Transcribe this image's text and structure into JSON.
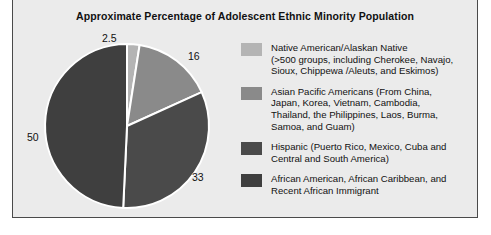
{
  "figure": {
    "title": "Approximate Percentage of Adolescent Ethnic Minority Population",
    "background_color": "#ebebeb",
    "border_color": "#4a4a4a"
  },
  "chart_data": {
    "type": "pie",
    "title": "Approximate Percentage of Adolescent Ethnic Minority Population",
    "xlabel": "",
    "ylabel": "",
    "grid": false,
    "legend_position": "right",
    "start_angle_deg": 0,
    "direction": "clockwise",
    "separator_color": "#ffffff",
    "categories": [
      "Native American/Alaskan Native",
      "Asian Pacific Americans",
      "Hispanic",
      "African American, African Caribbean, and Recent African Immigrant"
    ],
    "values": [
      2.5,
      16,
      33,
      50
    ],
    "data_labels": [
      "2.5",
      "16",
      "33",
      "50"
    ],
    "colors": [
      "#b4b4b4",
      "#8a8a8a",
      "#4a4a4a",
      "#3f3f3f"
    ]
  },
  "legend": {
    "items": [
      {
        "swatch_color": "#b4b4b4",
        "text": "Native American/Alaskan Native\n(>500 groups, including Cherokee, Navajo,\nSioux, Chippewa /Aleuts, and Eskimos)"
      },
      {
        "swatch_color": "#8a8a8a",
        "text": "Asian Pacific Americans (From China,\nJapan, Korea, Vietnam, Cambodia,\nThailand, the Philippines, Laos, Burma,\nSamoa, and Guam)"
      },
      {
        "swatch_color": "#4a4a4a",
        "text": "Hispanic (Puerto Rico, Mexico, Cuba and\nCentral and South America)"
      },
      {
        "swatch_color": "#3f3f3f",
        "text": "African American, African Caribbean, and\nRecent African Immigrant"
      }
    ]
  }
}
